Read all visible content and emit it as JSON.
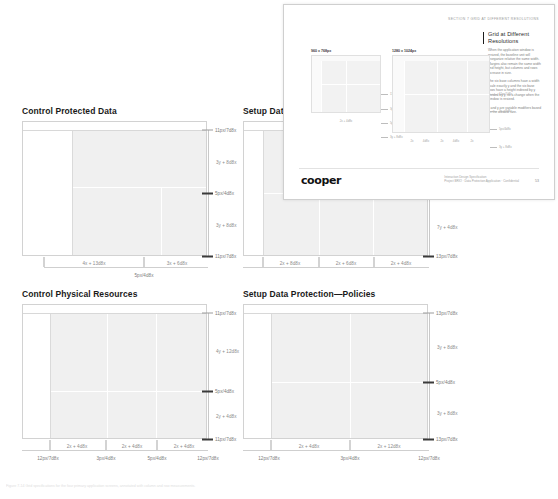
{
  "document": {
    "caption": "Figure 7-14  Grid specifications for the four primary application screens, annotated with column and row measurements."
  },
  "panels": [
    {
      "id": "control-protected-data",
      "title": "Control Protected Data",
      "v_ticks": [
        {
          "label": "11px/7d8x",
          "pos": 0.0,
          "bold": false
        },
        {
          "label": "5px/4d8x",
          "pos": 0.5,
          "bold": true
        },
        {
          "label": "11px/7d8x",
          "pos": 1.0,
          "bold": true
        }
      ],
      "v_spans": [
        {
          "label": "3y + 8d8x",
          "pos": 0.25
        },
        {
          "label": "3y + 8d8x",
          "pos": 0.75
        }
      ],
      "h_ticks": [
        {
          "label": "5px/4d8x",
          "pos": 0.5
        }
      ],
      "h_spans": [
        {
          "label": "4x + 13d8x",
          "pos": 0.27
        },
        {
          "label": "3x + 6d8x",
          "pos": 0.75
        }
      ],
      "grid": {
        "cols": [
          0.66
        ],
        "rows": [
          0.45
        ]
      }
    },
    {
      "id": "setup-data",
      "title": "Setup Data",
      "v_ticks": [
        {
          "label": "5px/4d8x",
          "pos": 0.5,
          "bold": true
        },
        {
          "label": "13px/7d8x",
          "pos": 1.0,
          "bold": true
        }
      ],
      "v_spans": [
        {
          "label": "7y + 4d8x",
          "pos": 0.77
        }
      ],
      "h_ticks": [],
      "h_spans": [
        {
          "label": "2x + 8d8x",
          "pos": 0.2
        },
        {
          "label": "2x + 6d8x",
          "pos": 0.5
        },
        {
          "label": "2x + 4d8x",
          "pos": 0.8
        }
      ],
      "grid": {
        "cols": [
          0.34,
          0.67
        ],
        "rows": [
          0.5
        ]
      }
    },
    {
      "id": "control-physical-resources",
      "title": "Control Physical Resources",
      "v_ticks": [
        {
          "label": "11px/7d8x",
          "pos": 0.0,
          "bold": false
        },
        {
          "label": "5px/4d8x",
          "pos": 0.62,
          "bold": true
        },
        {
          "label": "11px/7d8x",
          "pos": 1.0,
          "bold": true
        }
      ],
      "v_spans": [
        {
          "label": "4y + 12d8x",
          "pos": 0.3
        },
        {
          "label": "2y + 4d8x",
          "pos": 0.82
        }
      ],
      "h_ticks": [
        {
          "label": "12px/7d8x",
          "pos": 0.02
        },
        {
          "label": "3px/4d8x",
          "pos": 0.35
        },
        {
          "label": "5px/4d8x",
          "pos": 0.68
        },
        {
          "label": "12px/7d8x",
          "pos": 1.0
        }
      ],
      "h_spans": [
        {
          "label": "2x + 4d8x",
          "pos": 0.19
        },
        {
          "label": "2x + 4d8x",
          "pos": 0.52
        },
        {
          "label": "2x + 4d8x",
          "pos": 0.85
        }
      ],
      "grid": {
        "cols": [
          0.36,
          0.68
        ],
        "rows": [
          0.62
        ]
      }
    },
    {
      "id": "setup-data-protection-policies",
      "title": "Setup Data Protection—Policies",
      "v_ticks": [
        {
          "label": "13px/7d8x",
          "pos": 0.0,
          "bold": false
        },
        {
          "label": "5px/4d8x",
          "pos": 0.55,
          "bold": true
        },
        {
          "label": "13px/7d8x",
          "pos": 1.0,
          "bold": true
        }
      ],
      "v_spans": [
        {
          "label": "3y + 8d8x",
          "pos": 0.27
        },
        {
          "label": "3y + 8d8x",
          "pos": 0.79
        }
      ],
      "h_ticks": [
        {
          "label": "12px/7d8x",
          "pos": 0.02
        },
        {
          "label": "3px/4d8x",
          "pos": 0.5
        },
        {
          "label": "12px/7d8x",
          "pos": 1.0
        }
      ],
      "h_spans": [
        {
          "label": "2x + 4d8x",
          "pos": 0.26
        },
        {
          "label": "2x + 12d8x",
          "pos": 0.75
        }
      ],
      "grid": {
        "cols": [
          0.5
        ],
        "rows": [
          0.55
        ]
      }
    }
  ],
  "inset": {
    "eyebrow": "SECTION 7    GRID AT DIFFERENT RESOLUTIONS",
    "heading": "Grid at Different Resolutions",
    "paragraphs": [
      "When the application window is resized, the baseline unit will reorganize relative the same width. Margins also remain the same width and height, but columns and rows increase in size.",
      "The six base columns have a width scale exactly y and the six base rows have a height indexed by y divided by y, so a change when the window is resized.",
      "x and y are variable modifiers based on the window size."
    ],
    "minis": [
      {
        "title": "960 x 768px",
        "tick_labels": [
          "11px/7d8x",
          "3y + 8d8x",
          "5px/4d8x",
          "3y + 8d8x",
          "11px/7d8x",
          "2x + 4d8x"
        ],
        "bottom_labels": []
      },
      {
        "title": "1280 x 1024px",
        "tick_labels": [
          "11px/7d8x",
          "3y + 8d8x",
          "5px/4d8x",
          "3y + 8d8x",
          "11px/7d8x"
        ],
        "bottom_labels": [
          "2x",
          "4d8x",
          "2x",
          "4d8x",
          "2x",
          "4d8x",
          "2x"
        ]
      }
    ],
    "logo": "cooper",
    "footer_lines": [
      "Interaction Design Specification",
      "Project BRIO · Data Protection Application · Confidential"
    ],
    "page_number": "53"
  },
  "colors": {
    "ink": "#1a1a1a",
    "muted": "#7b7b7b",
    "rule": "#c9c9c9",
    "fill": "#f0f0f0",
    "tick_bold": "#3a3a3a"
  }
}
